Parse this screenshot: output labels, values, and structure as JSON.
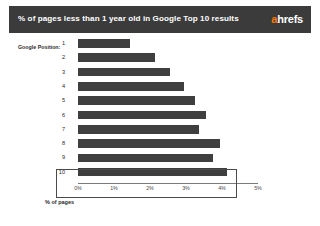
{
  "header": {
    "title": "% of pages less than 1 year old in Google Top 10 results",
    "brand_a": "a",
    "brand_rest": "hrefs",
    "band_color": "#3b3b3b",
    "brand_accent_color": "#ff7a00"
  },
  "chart_data": {
    "type": "bar",
    "orientation": "horizontal",
    "title": "% of pages less than 1 year old in Google Top 10 results",
    "subtitle": "",
    "xlabel": "% of pages",
    "ylabel": "Google Position:",
    "categories": [
      "1",
      "2",
      "3",
      "4",
      "5",
      "6",
      "7",
      "8",
      "9",
      "10"
    ],
    "values": [
      1.45,
      2.15,
      2.55,
      2.95,
      3.25,
      3.55,
      3.35,
      3.95,
      3.75,
      4.15
    ],
    "xlim": [
      0,
      5
    ],
    "xticks": [
      0,
      1,
      2,
      3,
      4,
      5
    ],
    "xtick_labels": [
      "0%",
      "1%",
      "2%",
      "3%",
      "4%",
      "5%"
    ],
    "grid": false,
    "legend": false,
    "bar_color": "#3f3f3f",
    "highlight": {
      "category": "10",
      "border_color": "#4a4a4a"
    }
  }
}
